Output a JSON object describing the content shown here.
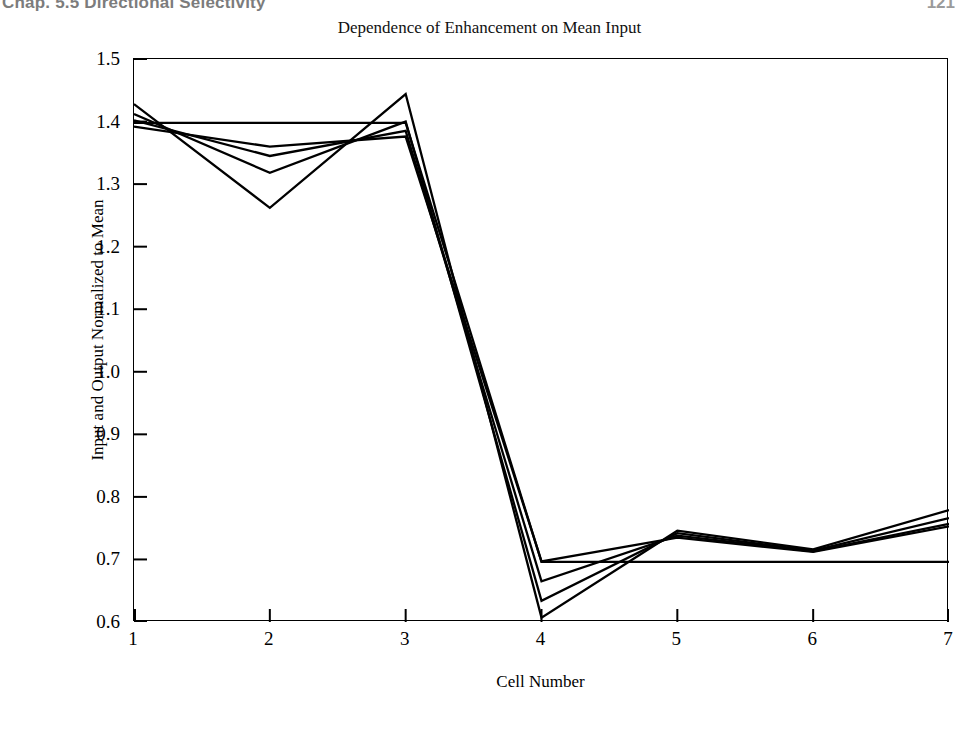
{
  "page": {
    "running_head_left": "Chap. 5.5   Directional Selectivity",
    "running_head_right": "121"
  },
  "figure": {
    "title": "Dependence of Enhancement on Mean Input",
    "x_axis_title": "Cell Number",
    "y_axis_title": "Input and Output Normalized to Mean"
  },
  "chart_data": {
    "type": "line",
    "title": "Dependence of Enhancement on Mean Input",
    "xlabel": "Cell Number",
    "ylabel": "Input and Output Normalized to Mean",
    "x": [
      1,
      2,
      3,
      4,
      5,
      6,
      7
    ],
    "xlim": [
      1,
      7
    ],
    "ylim": [
      0.6,
      1.5
    ],
    "xticks": [
      1,
      2,
      3,
      4,
      5,
      6,
      7
    ],
    "yticks": [
      0.6,
      0.7,
      0.8,
      0.9,
      1.0,
      1.1,
      1.2,
      1.3,
      1.4,
      1.5
    ],
    "ytick_labels": [
      "0.6",
      "0.7",
      "0.8",
      "0.9",
      "1.0",
      "1.1",
      "1.2",
      "1.3",
      "1.4",
      "1.5"
    ],
    "xtick_labels": [
      "1",
      "2",
      "3",
      "4",
      "5",
      "6",
      "7"
    ],
    "grid": false,
    "legend": null,
    "line_color": "#000000",
    "series": [
      {
        "name": "input",
        "values": [
          1.398,
          1.398,
          1.398,
          0.696,
          0.696,
          0.696,
          0.696
        ]
      },
      {
        "name": "output-1",
        "values": [
          1.392,
          1.36,
          1.376,
          0.697,
          0.735,
          0.712,
          0.753
        ]
      },
      {
        "name": "output-2",
        "values": [
          1.402,
          1.345,
          1.385,
          0.665,
          0.738,
          0.713,
          0.757
        ]
      },
      {
        "name": "output-3",
        "values": [
          1.412,
          1.318,
          1.4,
          0.634,
          0.742,
          0.714,
          0.766
        ]
      },
      {
        "name": "output-4",
        "values": [
          1.428,
          1.262,
          1.444,
          0.607,
          0.746,
          0.716,
          0.779
        ]
      }
    ]
  }
}
